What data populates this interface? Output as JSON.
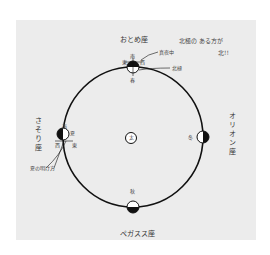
{
  "diagram": {
    "sun": {
      "label": "太"
    },
    "seasons": {
      "spring": "春",
      "summer": "夏",
      "autumn": "秋",
      "winter": "冬"
    },
    "constellations": {
      "top": "おとめ座",
      "right": "オリオン座",
      "bottom": "ペガスス座",
      "left": "さそり座"
    },
    "annotations": {
      "note_line1": "北極の ある方が",
      "note_line2": "北!!",
      "midnight": "真夜中",
      "north_pole": "北極",
      "summer_evening": "夏の明け方",
      "dir_south": "南",
      "dir_east": "東",
      "dir_west": "西",
      "small_s": "南",
      "small_w": "西",
      "small_e": "東"
    },
    "colors": {
      "panel": "#ececec",
      "orbit": "#111111",
      "text": "#333333"
    }
  }
}
